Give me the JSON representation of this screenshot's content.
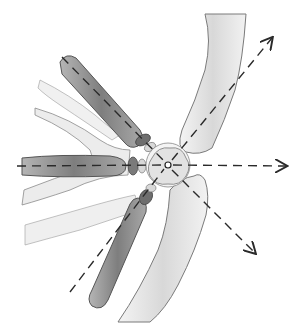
{
  "figure": {
    "type": "anatomical-illustration",
    "center": {
      "x": 168,
      "y": 163
    },
    "colors": {
      "background": "#ffffff",
      "bone_light": "#e6e6e6",
      "bone_outline": "#6e6e6e",
      "bone_dark": "#8a8a8a",
      "disc": "#7a7a7a",
      "dash": "#2a2a2a"
    },
    "arrows": [
      {
        "name": "arrow-up-right",
        "from": [
          168,
          163
        ],
        "to": [
          272,
          38
        ]
      },
      {
        "name": "arrow-right",
        "from": [
          168,
          163
        ],
        "to": [
          285,
          166
        ]
      },
      {
        "name": "arrow-down-right",
        "from": [
          168,
          163
        ],
        "to": [
          255,
          253
        ]
      }
    ],
    "dashed_lines": [
      {
        "name": "upper-left-axis",
        "from": [
          62,
          57
        ],
        "to": [
          168,
          163
        ]
      },
      {
        "name": "left-axis",
        "from": [
          17,
          166
        ],
        "to": [
          168,
          163
        ]
      },
      {
        "name": "lower-left-axis",
        "from": [
          70,
          292
        ],
        "to": [
          168,
          163
        ]
      }
    ]
  }
}
